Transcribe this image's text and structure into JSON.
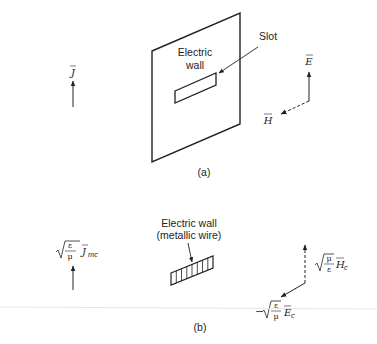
{
  "figure_a": {
    "caption": "(a)",
    "plate_label_line1": "Electric",
    "plate_label_line2": "wall",
    "slot_label": "Slot",
    "current_label": "J",
    "e_field_label": "E",
    "h_field_label": "H"
  },
  "figure_b": {
    "caption": "(b)",
    "wire_label_line1": "Electric wall",
    "wire_label_line2": "(metallic wire)",
    "current_label": {
      "coef_num": "ε",
      "coef_den": "μ",
      "symbol": "J",
      "subscript": "mc"
    },
    "h_field_label": {
      "coef_num": "μ",
      "coef_den": "ε",
      "symbol": "H",
      "subscript": "c"
    },
    "e_field_label": {
      "sign": "−",
      "coef_num": "ε",
      "coef_den": "μ",
      "symbol": "E",
      "subscript": "c"
    }
  },
  "colors": {
    "line": "#222222",
    "divider": "#e6e6e6"
  }
}
